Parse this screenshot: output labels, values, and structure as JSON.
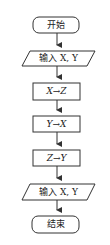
{
  "flowchart": {
    "nodes": [
      {
        "id": "start",
        "type": "terminal",
        "label": "开始"
      },
      {
        "id": "input1",
        "type": "io",
        "label": "输入 X, Y"
      },
      {
        "id": "step1",
        "type": "process",
        "label": "X→Z"
      },
      {
        "id": "step2",
        "type": "process",
        "label": "Y→X"
      },
      {
        "id": "step3",
        "type": "process",
        "label": "Z→Y"
      },
      {
        "id": "output1",
        "type": "io",
        "label": "输入 X, Y"
      },
      {
        "id": "end",
        "type": "terminal",
        "label": "结束"
      }
    ],
    "edges": [
      [
        "start",
        "input1"
      ],
      [
        "input1",
        "step1"
      ],
      [
        "step1",
        "step2"
      ],
      [
        "step2",
        "step3"
      ],
      [
        "step3",
        "output1"
      ],
      [
        "output1",
        "end"
      ]
    ],
    "colors": {
      "stroke": "#333333",
      "background": "#ffffff"
    }
  }
}
